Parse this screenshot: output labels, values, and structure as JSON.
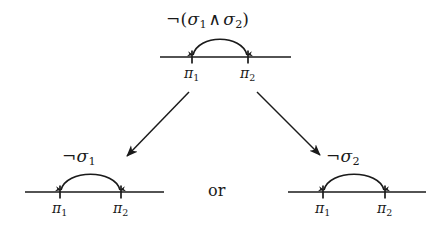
{
  "figure": {
    "background_color": "#ffffff",
    "ink_color": "#1a1a1a",
    "connective_label": "or"
  },
  "nodes": {
    "top": {
      "name": "negated-conjunction",
      "formula": {
        "negation": "¬",
        "open_paren": "(",
        "left_var": "σ",
        "left_sub": "1",
        "wedge": "∧",
        "right_var": "σ",
        "right_sub": "2",
        "close_paren": ")"
      },
      "left_tick": {
        "var": "π",
        "sub": "1"
      },
      "right_tick": {
        "var": "π",
        "sub": "2"
      }
    },
    "bottom_left": {
      "name": "negated-sigma-1",
      "formula": {
        "negation": "¬",
        "var": "σ",
        "sub": "1"
      },
      "left_tick": {
        "var": "π",
        "sub": "1"
      },
      "right_tick": {
        "var": "π",
        "sub": "2"
      }
    },
    "bottom_right": {
      "name": "negated-sigma-2",
      "formula": {
        "negation": "¬",
        "var": "σ",
        "sub": "2"
      },
      "left_tick": {
        "var": "π",
        "sub": "1"
      },
      "right_tick": {
        "var": "π",
        "sub": "2"
      }
    }
  }
}
